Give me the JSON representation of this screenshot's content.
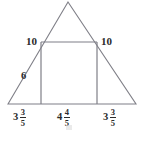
{
  "figure": {
    "name": "triangle-with-inscribed-square",
    "stroke_color": "#7f7f87",
    "text_color": "#2b2b2b",
    "background_color": "#ffffff"
  },
  "labels": {
    "left_slant_upper": "10",
    "right_slant_upper": "10",
    "left_slant_lower": "6"
  },
  "base_segments": [
    {
      "name": "left",
      "whole": "3",
      "numerator": "3",
      "denominator": "5",
      "text": "3 3/5"
    },
    {
      "name": "middle",
      "whole": "4",
      "numerator": "4",
      "denominator": "5",
      "text": "4 4/5"
    },
    {
      "name": "right",
      "whole": "3",
      "numerator": "3",
      "denominator": "5",
      "text": "3 3/5"
    }
  ],
  "geometry": {
    "apex": {
      "x": 68,
      "y": 2
    },
    "base_left": {
      "x": 8,
      "y": 104
    },
    "base_right": {
      "x": 136,
      "y": 104
    },
    "square_top_left": {
      "x": 41,
      "y": 42
    },
    "square_top_right": {
      "x": 97,
      "y": 42
    },
    "square_bottom_left": {
      "x": 41,
      "y": 104
    },
    "square_bottom_right": {
      "x": 97,
      "y": 104
    }
  }
}
